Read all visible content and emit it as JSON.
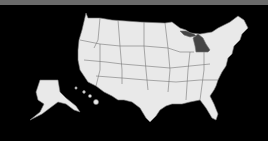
{
  "map": {
    "title": "United States",
    "highlighted_state": "Michigan",
    "colors": {
      "background": "#000000",
      "state_fill": "#e9e9e9",
      "state_border": "#777777",
      "highlight_fill": "#444444",
      "top_bar": "#6a6a6a",
      "right_edge": "#ffffff"
    }
  }
}
